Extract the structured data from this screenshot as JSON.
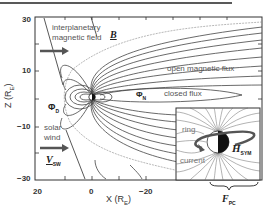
{
  "figure": {
    "type": "magnetosphere-diagram",
    "axes": {
      "y_label": "Z (R",
      "y_label_sub": "E",
      "y_label_close": ")",
      "x_label": "X (R",
      "x_label_sub": "E",
      "x_label_close": ")",
      "y_ticks": [
        "30",
        "10",
        "−10",
        "−30"
      ],
      "x_ticks": [
        "20",
        "0",
        "−20"
      ]
    },
    "labels": {
      "imf_line1": "interplanetary",
      "imf_line2": "magnetic field",
      "imf_symbol": "B",
      "solar_wind_line1": "solar",
      "solar_wind_line2": "wind",
      "vsw_symbol": "V",
      "vsw_sub": "SW",
      "phi_d": "Φ",
      "phi_d_sub": "D",
      "phi_n": "Φ",
      "phi_n_sub": "N",
      "open_flux": "open magnetic flux",
      "closed_flux": "closed flux",
      "ring_line1": "ring",
      "ring_line2": "current",
      "hsym": "H",
      "hsym_sub": "SYM",
      "fpc": "F",
      "fpc_sub": "PC"
    },
    "colors": {
      "line": "#444444",
      "frame": "#333333",
      "arrow": "#555555",
      "text": "#555555"
    }
  }
}
